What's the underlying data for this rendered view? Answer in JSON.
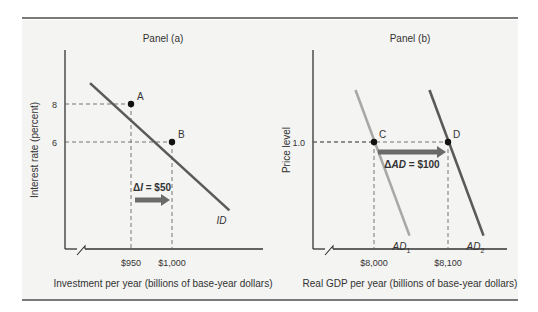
{
  "chart_data": [
    {
      "type": "line",
      "title": "Panel (a)",
      "xlabel": "Investment per year (billions of base-year dollars)",
      "ylabel": "Interest rate (percent)",
      "x_ticks": [
        {
          "value": 950,
          "label": "$950"
        },
        {
          "value": 1000,
          "label": "$1,000"
        }
      ],
      "y_ticks": [
        {
          "value": 8,
          "label": "8"
        },
        {
          "value": 6,
          "label": "6"
        }
      ],
      "series": [
        {
          "name": "ID",
          "label": "ID",
          "color": "#5a5a5a",
          "points": [
            [
              900,
              9.1
            ],
            [
              1070,
              2.4
            ]
          ]
        }
      ],
      "points": [
        {
          "label": "A",
          "x": 950,
          "y": 8
        },
        {
          "label": "B",
          "x": 1000,
          "y": 6
        }
      ],
      "shift_arrow": {
        "from": 950,
        "to": 1000,
        "label_prefix": "Δ",
        "label_var": "I",
        "label_suffix": " = $50",
        "color": "#6b6b6b"
      },
      "axis_break": true
    },
    {
      "type": "line",
      "title": "Panel (b)",
      "xlabel": "Real GDP per year (billions of base-year dollars)",
      "ylabel": "Price level",
      "x_ticks": [
        {
          "value": 8000,
          "label": "$8,000"
        },
        {
          "value": 8100,
          "label": "$8,100"
        }
      ],
      "y_ticks": [
        {
          "value": 1.0,
          "label": "1.0"
        }
      ],
      "series": [
        {
          "name": "AD1",
          "label": "AD",
          "sub": "1",
          "color": "#a8a8a8",
          "points": [
            [
              7975,
              1.2
            ],
            [
              8048,
              0.64
            ]
          ]
        },
        {
          "name": "AD2",
          "label": "AD",
          "sub": "2",
          "color": "#5a5a5a",
          "points": [
            [
              8075,
              1.2
            ],
            [
              8148,
              0.64
            ]
          ]
        }
      ],
      "points": [
        {
          "label": "C",
          "x": 8000,
          "y": 1.0
        },
        {
          "label": "D",
          "x": 8100,
          "y": 1.0
        }
      ],
      "shift_arrow": {
        "from": 8000,
        "to": 8100,
        "label_prefix": "Δ",
        "label_var": "AD",
        "label_suffix": " = $100",
        "color": "#6b6b6b"
      },
      "axis_break": true
    }
  ],
  "colors": {
    "rule": "#7a7a7a",
    "axis": "#333333",
    "panel_bg": "#f3f3f1"
  }
}
